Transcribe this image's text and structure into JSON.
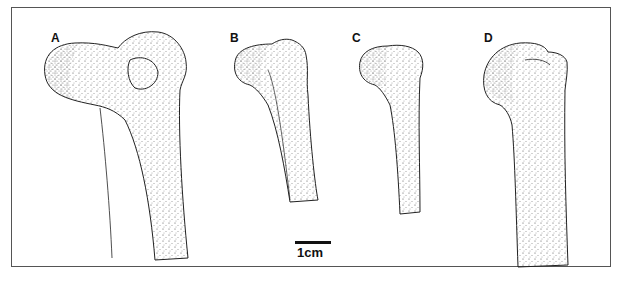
{
  "figure": {
    "type": "illustration",
    "panels": [
      {
        "label": "A"
      },
      {
        "label": "B"
      },
      {
        "label": "C"
      },
      {
        "label": "D"
      }
    ],
    "scale_bar": {
      "label": "1cm"
    }
  }
}
